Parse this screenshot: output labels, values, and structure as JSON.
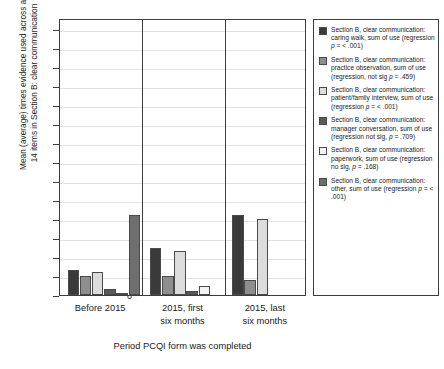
{
  "chart_data": {
    "type": "bar",
    "title": "",
    "ylabel": "Mean (average) times evidence used across all 14 items in Section B: clear communication",
    "xlabel": "Period PCQI form was completed",
    "ylim": [
      0,
      14.6
    ],
    "yticks": [
      0,
      1,
      2,
      3,
      4,
      5,
      6,
      7,
      8,
      9,
      10,
      11,
      12,
      13,
      14
    ],
    "grid": true,
    "legend_position": "right",
    "categories": [
      "Before 2015",
      "2015, first\nsix months",
      "2015, last\nsix months"
    ],
    "series": [
      {
        "name": "caring walk",
        "legend_label": "Section B, clear communication: caring walk, sum of use (regression p = < .001)",
        "color": "#3a3a3a",
        "values": [
          1.3,
          2.5,
          4.2
        ]
      },
      {
        "name": "practice observation",
        "legend_label": "Section B, clear communication: practice observation, sum of use (regression, not sig p = .459)",
        "color": "#8e8e8e",
        "values": [
          1.0,
          1.0,
          0.8
        ]
      },
      {
        "name": "patient/family interview",
        "legend_label": "Section B, clear communication: patient/family interview, sum of use (regression p = < .001)",
        "color": "#dcdcdc",
        "values": [
          1.2,
          2.3,
          4.0
        ]
      },
      {
        "name": "manager conversation",
        "legend_label": "Section B, clear communication: manager conversation, sum of use (regression not sig, p = .709)",
        "color": "#5a5a5a",
        "values": [
          0.3,
          0.2,
          0.0
        ]
      },
      {
        "name": "paperwork",
        "legend_label": "Section B, clear communication: paperwork, sum of use (regression no sig, p = .168)",
        "color": "#f4f4f4",
        "values": [
          0.1,
          0.45,
          0.0
        ]
      },
      {
        "name": "other",
        "legend_label": "Section B, clear communication: other, sum of use (regression p = < .001)",
        "color": "#6e6e6e",
        "values": [
          4.2,
          0.0,
          0.0
        ]
      }
    ]
  },
  "legend": {
    "items": [
      {
        "color": "#3a3a3a",
        "label": "Section B, clear communication: caring walk, sum of use (regression p = < .001)"
      },
      {
        "color": "#8e8e8e",
        "label": "Section B, clear communication: practice observation, sum of use (regression, not sig p = .459)"
      },
      {
        "color": "#dcdcdc",
        "label": "Section B, clear communication: patient/family interview, sum of use (regression p = < .001)"
      },
      {
        "color": "#5a5a5a",
        "label": "Section B, clear communication: manager conversation, sum of use (regression not sig, p = .709)"
      },
      {
        "color": "#f4f4f4",
        "label": "Section B, clear communication: paperwork, sum of use (regression no sig, p = .168)"
      },
      {
        "color": "#6e6e6e",
        "label": "Section B, clear communication: other, sum of use (regression p = < .001)"
      }
    ]
  },
  "axes": {
    "y_title": "Mean (average) times evidence used across all\n14 items in Section B: clear communication",
    "x_title": "Period PCQI form was completed"
  }
}
